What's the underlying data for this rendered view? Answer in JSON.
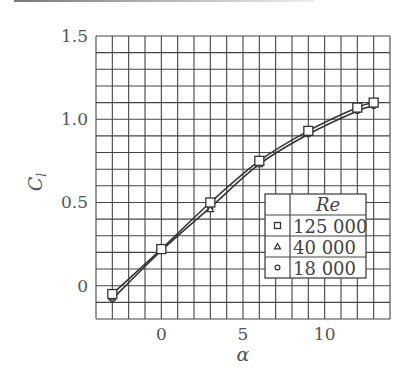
{
  "chart_data": {
    "type": "line",
    "title": "",
    "xlabel": "α",
    "ylabel": "C_l",
    "xlim": [
      -4,
      14
    ],
    "ylim": [
      -0.2,
      1.5
    ],
    "xticks": [
      0,
      5,
      10
    ],
    "xtick_labels": [
      "0",
      "5",
      "10"
    ],
    "yticks": [
      0,
      0.5,
      1.0,
      1.5
    ],
    "ytick_labels": [
      "0",
      "0.5",
      "1.0",
      "1.5"
    ],
    "grid": true,
    "grid_step_x": 1,
    "grid_step_y": 0.1,
    "legend": {
      "title": "Re",
      "position": "lower right",
      "entries": [
        {
          "marker": "square",
          "label": "125 000"
        },
        {
          "marker": "triangle",
          "label": "40 000"
        },
        {
          "marker": "circle",
          "label": "18 000"
        }
      ]
    },
    "series": [
      {
        "name": "125 000",
        "marker": "square",
        "x": [
          -3,
          0,
          3,
          6,
          9,
          12,
          13
        ],
        "y": [
          -0.05,
          0.22,
          0.5,
          0.75,
          0.93,
          1.07,
          1.1
        ]
      },
      {
        "name": "40 000",
        "marker": "triangle",
        "x": [
          -3,
          0,
          3,
          6,
          9,
          12,
          13
        ],
        "y": [
          -0.07,
          0.21,
          0.46,
          0.73,
          0.92,
          1.06,
          1.09
        ]
      },
      {
        "name": "18 000",
        "marker": "circle",
        "x": [
          -3,
          0,
          3,
          6,
          9,
          12,
          13
        ],
        "y": [
          -0.08,
          0.21,
          0.47,
          0.73,
          0.91,
          1.05,
          1.08
        ]
      }
    ]
  }
}
